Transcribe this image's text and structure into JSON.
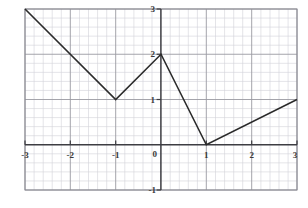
{
  "chart_data": {
    "type": "line",
    "title": "",
    "xlabel": "",
    "ylabel": "",
    "xlim": [
      -3,
      3
    ],
    "ylim": [
      -1,
      3
    ],
    "grid": true,
    "minor_grid": true,
    "minor_ticks_per_unit": 5,
    "legend": "none",
    "xticks": [
      -3,
      -2,
      -1,
      0,
      1,
      2,
      3
    ],
    "yticks": [
      -1,
      0,
      1,
      2,
      3
    ],
    "xtick_labels": [
      "-3",
      "-2",
      "-1",
      "0",
      "1",
      "2",
      "3"
    ],
    "ytick_labels": [
      "-1",
      "0",
      "1",
      "2",
      "3"
    ],
    "series": [
      {
        "name": "piecewise-linear",
        "x": [
          -3,
          -1,
          0,
          1,
          3
        ],
        "y": [
          3,
          1,
          2,
          0,
          1
        ],
        "color": "#2b2b2b",
        "linewidth": 1.6
      }
    ],
    "vertices": [
      {
        "x": -3,
        "y": 3
      },
      {
        "x": -1,
        "y": 1
      },
      {
        "x": 0,
        "y": 2
      },
      {
        "x": 1,
        "y": 0
      },
      {
        "x": 3,
        "y": 1
      }
    ]
  },
  "axis_labels": {
    "x": [
      {
        "value": -3,
        "text": "-3"
      },
      {
        "value": -2,
        "text": "-2"
      },
      {
        "value": -1,
        "text": "-1"
      },
      {
        "value": 1,
        "text": "1"
      },
      {
        "value": 2,
        "text": "2"
      },
      {
        "value": 3,
        "text": "3"
      }
    ],
    "y": [
      {
        "value": 3,
        "text": "3"
      },
      {
        "value": 2,
        "text": "2"
      },
      {
        "value": 1,
        "text": "1"
      },
      {
        "value": -1,
        "text": "-1"
      }
    ],
    "origin": "0"
  },
  "colors": {
    "background": "#ffffff",
    "minor_grid": "#d2d2d8",
    "major_grid": "#9a9aa2",
    "border": "#8a8a92",
    "axis": "#3d3d42",
    "curve": "#2b2b2b",
    "label": "#3a3a3a"
  }
}
